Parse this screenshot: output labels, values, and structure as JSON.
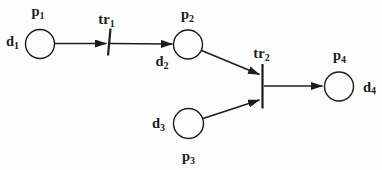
{
  "figure": {
    "type": "petri-net-diagram",
    "width": 382,
    "height": 170,
    "background": "#fdfdfd",
    "ink": "#1c1c1c",
    "places": [
      {
        "id": "p1",
        "cx": 40,
        "cy": 44,
        "r": 14.5,
        "name_label": {
          "main": "p",
          "sub": "1",
          "x": 38,
          "y": 16
        },
        "data_label": {
          "main": "d",
          "sub": "1",
          "x": 12.5,
          "y": 46
        }
      },
      {
        "id": "p2",
        "cx": 188,
        "cy": 44.5,
        "r": 14.5,
        "name_label": {
          "main": "p",
          "sub": "2",
          "x": 187.5,
          "y": 19
        },
        "data_label": {
          "main": "d",
          "sub": "2",
          "x": 162,
          "y": 66
        }
      },
      {
        "id": "p3",
        "cx": 188.5,
        "cy": 123.5,
        "r": 15,
        "name_label": {
          "main": "p",
          "sub": "3",
          "x": 188.5,
          "y": 161
        },
        "data_label": {
          "main": "d",
          "sub": "3",
          "x": 158.5,
          "y": 128
        }
      },
      {
        "id": "p4",
        "cx": 339,
        "cy": 86.5,
        "r": 14.5,
        "name_label": {
          "main": "p",
          "sub": "4",
          "x": 339.5,
          "y": 60
        },
        "data_label": {
          "main": "d",
          "sub": "4",
          "x": 369.5,
          "y": 91.5
        }
      }
    ],
    "transitions": [
      {
        "id": "tr1",
        "x1": 110.5,
        "y1": 28.5,
        "x2": 108,
        "y2": 55.5,
        "label": {
          "main": "tr",
          "sub": "1",
          "x": 106.5,
          "y": 24
        }
      },
      {
        "id": "tr2",
        "x1": 262.5,
        "y1": 64,
        "x2": 262.5,
        "y2": 108.5,
        "label": {
          "main": "tr",
          "sub": "2",
          "x": 261.5,
          "y": 58
        }
      }
    ],
    "arcs": [
      {
        "name": "arc-p1-to-tr1",
        "x1": 55,
        "y1": 43.5,
        "x2": 106.5,
        "y2": 43.5
      },
      {
        "name": "arc-tr1-to-p2",
        "x1": 110,
        "y1": 43.5,
        "x2": 172.5,
        "y2": 44
      },
      {
        "name": "arc-p2-to-tr2",
        "x1": 201.5,
        "y1": 50.5,
        "x2": 259.5,
        "y2": 74.5
      },
      {
        "name": "arc-p3-to-tr2",
        "x1": 203,
        "y1": 118.5,
        "x2": 259.5,
        "y2": 100
      },
      {
        "name": "arc-tr2-to-p4",
        "x1": 264,
        "y1": 86,
        "x2": 322.5,
        "y2": 86
      }
    ],
    "style": {
      "circle_stroke_width": 1.4,
      "arc_stroke_width": 1.5,
      "bar_stroke_width": 2.2,
      "arrowhead_length": 12,
      "arrowhead_width": 8
    }
  }
}
